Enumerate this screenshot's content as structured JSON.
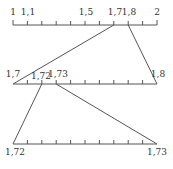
{
  "rulers": [
    {
      "name": "ruler-1-to-2",
      "labels": [
        {
          "text": "1",
          "x": 13
        },
        {
          "text": "1,1",
          "x": 27
        },
        {
          "text": "1,5",
          "x": 85
        },
        {
          "text": "1,7",
          "x": 114
        },
        {
          "text": "1,8",
          "x": 128
        },
        {
          "text": "2",
          "x": 157
        }
      ]
    },
    {
      "name": "ruler-1.7-to-1.8",
      "labels": [
        {
          "text": "1,7",
          "x": 13
        },
        {
          "text": "1,72",
          "x": 41
        },
        {
          "text": "1,73",
          "x": 56
        },
        {
          "text": "1,8",
          "x": 157
        }
      ]
    },
    {
      "name": "ruler-1.72-to-1.73",
      "labels": [
        {
          "text": "1,72",
          "x": 13
        },
        {
          "text": "1,73",
          "x": 157
        }
      ]
    }
  ],
  "colors": {
    "line": "#555555",
    "text": "#333333"
  }
}
